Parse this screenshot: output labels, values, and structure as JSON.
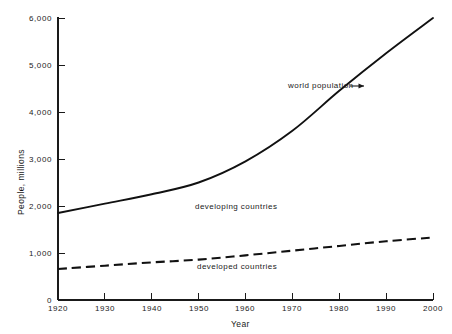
{
  "chart_data": {
    "type": "line",
    "title": "",
    "xlabel": "Year",
    "ylabel": "People, millions",
    "xlim": [
      1920,
      2000
    ],
    "ylim": [
      0,
      6000
    ],
    "grid": false,
    "legend_position": "inline-annotations",
    "xticks": [
      1920,
      1930,
      1940,
      1950,
      1960,
      1970,
      1980,
      1990,
      2000
    ],
    "xtick_labels": [
      "1920",
      "1930",
      "1940",
      "1950",
      "1960",
      "1970",
      "1980",
      "1990",
      "2000"
    ],
    "yticks": [
      0,
      1000,
      2000,
      3000,
      4000,
      5000,
      6000
    ],
    "ytick_labels": [
      "0",
      "1,000",
      "2,000",
      "3,000",
      "4,000",
      "5,000",
      "6,000"
    ],
    "x": [
      1920,
      1930,
      1940,
      1950,
      1960,
      1970,
      1980,
      1990,
      2000
    ],
    "series": [
      {
        "name": "world population",
        "style": "solid",
        "color": "#111111",
        "values": [
          1850,
          2050,
          2250,
          2500,
          2950,
          3600,
          4450,
          5250,
          6000
        ]
      },
      {
        "name": "developed countries",
        "style": "dashed",
        "color": "#111111",
        "values": [
          660,
          730,
          800,
          860,
          950,
          1050,
          1150,
          1250,
          1330
        ]
      }
    ],
    "annotations": [
      {
        "text": "world population",
        "x": 1970,
        "y": 4550,
        "arrow": true
      },
      {
        "text": "developing countries",
        "x": 1952,
        "y": 2000,
        "arrow": false
      },
      {
        "text": "developed countries",
        "x": 1952,
        "y": 730,
        "arrow": false
      }
    ]
  },
  "axes": {
    "y_axis_title": "People, millions",
    "x_axis_title": "Year",
    "ytick_labels": {
      "t0": "0",
      "t1": "1,000",
      "t2": "2,000",
      "t3": "3,000",
      "t4": "4,000",
      "t5": "5,000",
      "t6": "6,000"
    },
    "xtick_labels": {
      "t0": "1920",
      "t1": "1930",
      "t2": "1940",
      "t3": "1950",
      "t4": "1960",
      "t5": "1970",
      "t6": "1980",
      "t7": "1990",
      "t8": "2000"
    }
  },
  "annotations": {
    "world_population": "world population",
    "developing_countries": "developing countries",
    "developed_countries": "developed countries"
  },
  "colors": {
    "background": "#ffffff",
    "ink": "#1a1a1a",
    "curve": "#111111"
  }
}
